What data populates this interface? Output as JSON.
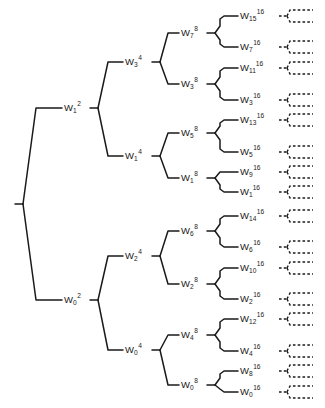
{
  "figure": {
    "line_color": "#1a1a1a",
    "dashed_color": "#1a1a1a",
    "background": "#ffffff"
  },
  "tree": {
    "root": {
      "name": "root-stub",
      "x": 15,
      "y": 204
    },
    "levels": [
      {
        "level": 2,
        "superscript": "2",
        "x": 64,
        "nodes": [
          {
            "base": "W",
            "sub": "1",
            "sup": "2",
            "text": "W1^2",
            "y": 108
          },
          {
            "base": "W",
            "sub": "0",
            "sup": "2",
            "text": "W0^2",
            "y": 300
          }
        ]
      },
      {
        "level": 4,
        "superscript": "4",
        "x": 125,
        "nodes": [
          {
            "base": "W",
            "sub": "3",
            "sup": "4",
            "text": "W3^4",
            "y": 62
          },
          {
            "base": "W",
            "sub": "1",
            "sup": "4",
            "text": "W1^4",
            "y": 156
          },
          {
            "base": "W",
            "sub": "2",
            "sup": "4",
            "text": "W2^4",
            "y": 256
          },
          {
            "base": "W",
            "sub": "0",
            "sup": "4",
            "text": "W0^4",
            "y": 350
          }
        ]
      },
      {
        "level": 8,
        "superscript": "8",
        "x": 181,
        "nodes": [
          {
            "base": "W",
            "sub": "7",
            "sup": "8",
            "text": "W7^8",
            "y": 33
          },
          {
            "base": "W",
            "sub": "3",
            "sup": "8",
            "text": "W3^8",
            "y": 84
          },
          {
            "base": "W",
            "sub": "5",
            "sup": "8",
            "text": "W5^8",
            "y": 133
          },
          {
            "base": "W",
            "sub": "1",
            "sup": "8",
            "text": "W1^8",
            "y": 178
          },
          {
            "base": "W",
            "sub": "6",
            "sup": "8",
            "text": "W6^8",
            "y": 231
          },
          {
            "base": "W",
            "sub": "2",
            "sup": "8",
            "text": "W2^8",
            "y": 284
          },
          {
            "base": "W",
            "sub": "4",
            "sup": "8",
            "text": "W4^8",
            "y": 335
          },
          {
            "base": "W",
            "sub": "0",
            "sup": "8",
            "text": "W0^8",
            "y": 385
          }
        ]
      },
      {
        "level": 16,
        "superscript": "16",
        "x": 240,
        "nodes": [
          {
            "base": "W",
            "sub": "15",
            "sup": "16",
            "text": "W15^16",
            "y": 16
          },
          {
            "base": "W",
            "sub": "7",
            "sup": "16",
            "text": "W7^16",
            "y": 47
          },
          {
            "base": "W",
            "sub": "11",
            "sup": "16",
            "text": "W11^16",
            "y": 68
          },
          {
            "base": "W",
            "sub": "3",
            "sup": "16",
            "text": "W3^16",
            "y": 100
          },
          {
            "base": "W",
            "sub": "13",
            "sup": "16",
            "text": "W13^16",
            "y": 120
          },
          {
            "base": "W",
            "sub": "5",
            "sup": "16",
            "text": "W5^16",
            "y": 152
          },
          {
            "base": "W",
            "sub": "9",
            "sup": "16",
            "text": "W9^16",
            "y": 172
          },
          {
            "base": "W",
            "sub": "1",
            "sup": "16",
            "text": "W1^16",
            "y": 192
          },
          {
            "base": "W",
            "sub": "14",
            "sup": "16",
            "text": "W14^16",
            "y": 216
          },
          {
            "base": "W",
            "sub": "6",
            "sup": "16",
            "text": "W6^16",
            "y": 247
          },
          {
            "base": "W",
            "sub": "10",
            "sup": "16",
            "text": "W10^16",
            "y": 268
          },
          {
            "base": "W",
            "sub": "2",
            "sup": "16",
            "text": "W2^16",
            "y": 299
          },
          {
            "base": "W",
            "sub": "12",
            "sup": "16",
            "text": "W12^16",
            "y": 319
          },
          {
            "base": "W",
            "sub": "4",
            "sup": "16",
            "text": "W4^16",
            "y": 351
          },
          {
            "base": "W",
            "sub": "8",
            "sup": "16",
            "text": "W8^16",
            "y": 371
          },
          {
            "base": "W",
            "sub": "0",
            "sup": "16",
            "text": "W0^16",
            "y": 392
          }
        ]
      }
    ],
    "continuations": {
      "name": "dashed-continuation-fork",
      "count": 16,
      "x": 287,
      "style": "dashed",
      "y_positions": [
        16,
        47,
        68,
        100,
        120,
        152,
        172,
        192,
        216,
        247,
        268,
        299,
        319,
        351,
        371,
        392
      ]
    }
  }
}
